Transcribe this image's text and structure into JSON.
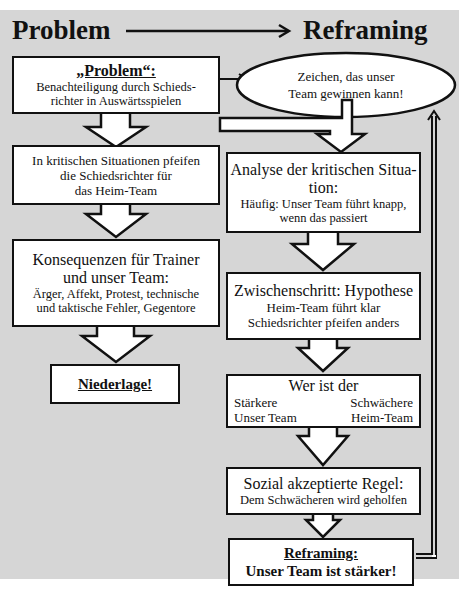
{
  "header": {
    "left_title": "Problem",
    "right_title": "Reframing"
  },
  "left_column": {
    "problem_box": {
      "title": "„Problem“:",
      "line1": "Benachteiligung durch Schieds-",
      "line2": "richter in Auswärtsspielen"
    },
    "critical_box": {
      "line1": "In kritischen Situationen pfeifen",
      "line2": "die Schiedsrichter für",
      "line3": "das Heim-Team"
    },
    "consequences_box": {
      "title1": "Konsequenzen für Trainer",
      "title2": "und unser Team:",
      "line1": "Ärger, Affekt, Protest, technische",
      "line2": "und taktische Fehler, Gegentore"
    },
    "defeat_box": {
      "label": "Niederlage!"
    }
  },
  "ellipse": {
    "line1": "Zeichen, das unser",
    "line2": "Team gewinnen kann!"
  },
  "right_column": {
    "analysis_box": {
      "title1": "Analyse der kritischen Situa-",
      "title2": "tion:",
      "line1": "Häufig: Unser Team führt knapp,",
      "line2": "wenn das passiert"
    },
    "hypothesis_box": {
      "title": "Zwischenschritt: Hypothese",
      "line1": "Heim-Team führt klar",
      "line2": "Schiedsrichter pfeifen anders"
    },
    "who_box": {
      "title": "Wer ist der",
      "left_label": "Stärkere",
      "right_label": "Schwächere",
      "left_value": "Unser Team",
      "right_value": "Heim-Team"
    },
    "rule_box": {
      "title": "Sozial akzeptierte Regel:",
      "line1": "Dem Schwächeren wird geholfen"
    },
    "reframing_box": {
      "title": "Reframing:",
      "line1": "Unser Team ist stärker!"
    }
  },
  "colors": {
    "background": "#d6d6d6",
    "box_fill": "#ffffff",
    "stroke": "#111111"
  }
}
